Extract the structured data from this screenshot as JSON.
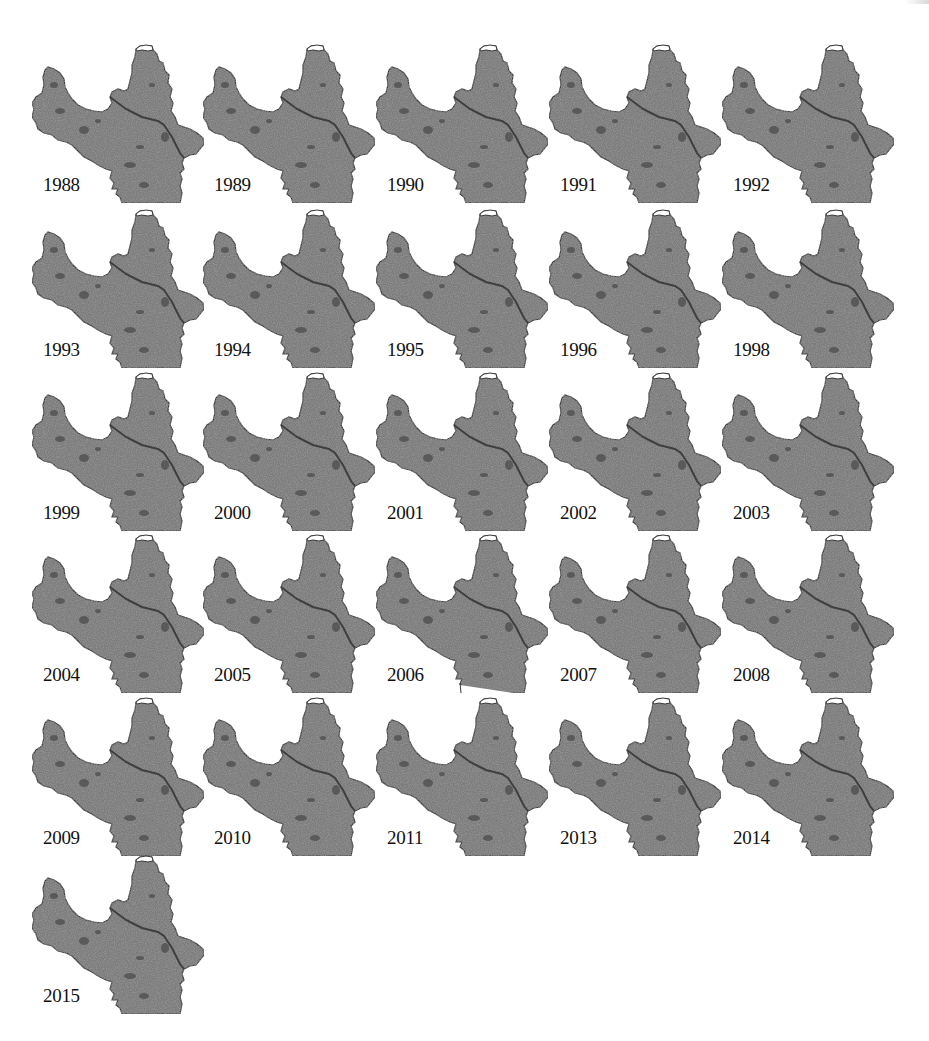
{
  "figure": {
    "map_fill_color": "#7b7b7b",
    "map_border_color": "#3a3a3a",
    "river_color": "#3f3f3f",
    "cap_color": "#ffffff",
    "background_color": "#ffffff"
  },
  "panels": [
    {
      "year": "1988"
    },
    {
      "year": "1989"
    },
    {
      "year": "1990"
    },
    {
      "year": "1991"
    },
    {
      "year": "1992"
    },
    {
      "year": "1993"
    },
    {
      "year": "1994"
    },
    {
      "year": "1995"
    },
    {
      "year": "1996"
    },
    {
      "year": "1998"
    },
    {
      "year": "1999"
    },
    {
      "year": "2000"
    },
    {
      "year": "2001"
    },
    {
      "year": "2002"
    },
    {
      "year": "2003"
    },
    {
      "year": "2004"
    },
    {
      "year": "2005"
    },
    {
      "year": "2006"
    },
    {
      "year": "2007"
    },
    {
      "year": "2008"
    },
    {
      "year": "2009"
    },
    {
      "year": "2010"
    },
    {
      "year": "2011"
    },
    {
      "year": "2013"
    },
    {
      "year": "2014"
    },
    {
      "year": "2015"
    }
  ]
}
